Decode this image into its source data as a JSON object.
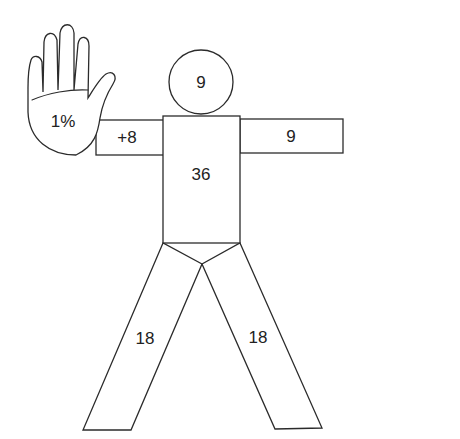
{
  "diagram": {
    "type": "body-surface-area-rule-of-nines",
    "colors": {
      "stroke": "#2b2b2b",
      "fill": "#ffffff",
      "text": "#222222"
    },
    "regions": {
      "head": {
        "label": "9"
      },
      "torso": {
        "label": "36"
      },
      "left_arm": {
        "label": "+8"
      },
      "right_arm": {
        "label": "9"
      },
      "palm": {
        "label": "1%"
      },
      "left_leg": {
        "label": "18"
      },
      "right_leg": {
        "label": "18"
      }
    }
  }
}
